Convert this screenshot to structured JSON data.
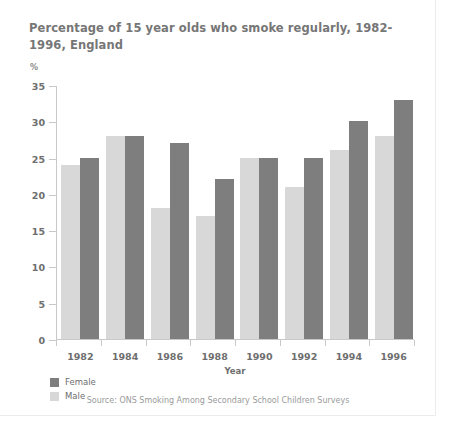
{
  "title": "Percentage of 15 year olds who smoke regularly, 1982-1996, England",
  "y_unit": "%",
  "source": "Source: ONS Smoking Among Secondary School Children Surveys",
  "legend": {
    "items": [
      {
        "label": "Female",
        "color": "#7e7e7e"
      },
      {
        "label": "Male",
        "color": "#d8d8d8"
      }
    ]
  },
  "chart_data": {
    "type": "bar",
    "title": "Percentage of 15 year olds who smoke regularly, 1982-1996, England",
    "xlabel": "Year",
    "ylabel": "%",
    "categories": [
      "1982",
      "1984",
      "1986",
      "1988",
      "1990",
      "1992",
      "1994",
      "1996"
    ],
    "series": [
      {
        "name": "Male",
        "color": "#d8d8d8",
        "values": [
          24,
          28,
          18,
          17,
          25,
          21,
          26,
          28
        ]
      },
      {
        "name": "Female",
        "color": "#7e7e7e",
        "values": [
          25,
          28,
          27,
          22,
          25,
          25,
          30,
          33
        ]
      }
    ],
    "ylim": [
      0,
      35
    ],
    "yticks": [
      0,
      5,
      10,
      15,
      20,
      25,
      30,
      35
    ],
    "ytick_labels": [
      "0",
      "5",
      "10",
      "15",
      "20",
      "25",
      "30",
      "35"
    ],
    "grid": false,
    "legend_position": "bottom-left"
  }
}
